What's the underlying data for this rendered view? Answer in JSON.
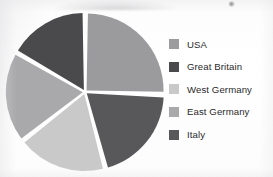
{
  "chart_data": {
    "type": "pie",
    "title": "",
    "categories": [
      "USA",
      "Great Britain",
      "West Germany",
      "East Germany",
      "Italy"
    ],
    "values": [
      25,
      17,
      19,
      19,
      20
    ],
    "units": "percent",
    "start_angle_deg": 0,
    "direction": "clockwise",
    "exploded": true,
    "legend_position": "right",
    "grid": false,
    "colors": [
      "#9b9b9d",
      "#4a4a4c",
      "#c9c9c9",
      "#a9a9ab",
      "#58585a"
    ],
    "slices": [
      {
        "label": "USA",
        "value": 25,
        "color": "#9b9b9d",
        "start_deg": 0,
        "end_deg": 92
      },
      {
        "label": "Italy",
        "value": 20,
        "color": "#58585a",
        "start_deg": 92,
        "end_deg": 165
      },
      {
        "label": "West Germany",
        "value": 19,
        "color": "#c9c9c9",
        "start_deg": 165,
        "end_deg": 232
      },
      {
        "label": "East Germany",
        "value": 19,
        "color": "#a9a9ab",
        "start_deg": 232,
        "end_deg": 300
      },
      {
        "label": "Great Britain",
        "value": 17,
        "color": "#4a4a4c",
        "start_deg": 300,
        "end_deg": 360
      }
    ]
  },
  "legend": {
    "items": [
      {
        "label": "USA",
        "color": "#9b9b9d"
      },
      {
        "label": "Great Britain",
        "color": "#4a4a4c"
      },
      {
        "label": "West Germany",
        "color": "#c9c9c9"
      },
      {
        "label": "East Germany",
        "color": "#a9a9ab"
      },
      {
        "label": "Italy",
        "color": "#58585a"
      }
    ]
  }
}
